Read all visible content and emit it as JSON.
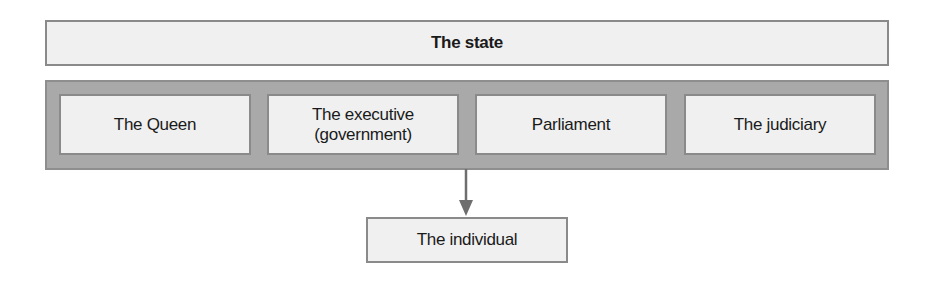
{
  "diagram": {
    "top": {
      "label": "The state"
    },
    "branches": [
      {
        "label": "The Queen"
      },
      {
        "label": "The executive\n(government)"
      },
      {
        "label": "Parliament"
      },
      {
        "label": "The judiciary"
      }
    ],
    "bottom": {
      "label": "The individual"
    },
    "edges": [
      {
        "from": "state-branches",
        "to": "The individual",
        "type": "arrow-down"
      }
    ],
    "colors": {
      "box_fill": "#f0f0f0",
      "box_border": "#8a8a8a",
      "band_fill": "#a9a9a9",
      "arrow": "#6e6e6e"
    }
  }
}
